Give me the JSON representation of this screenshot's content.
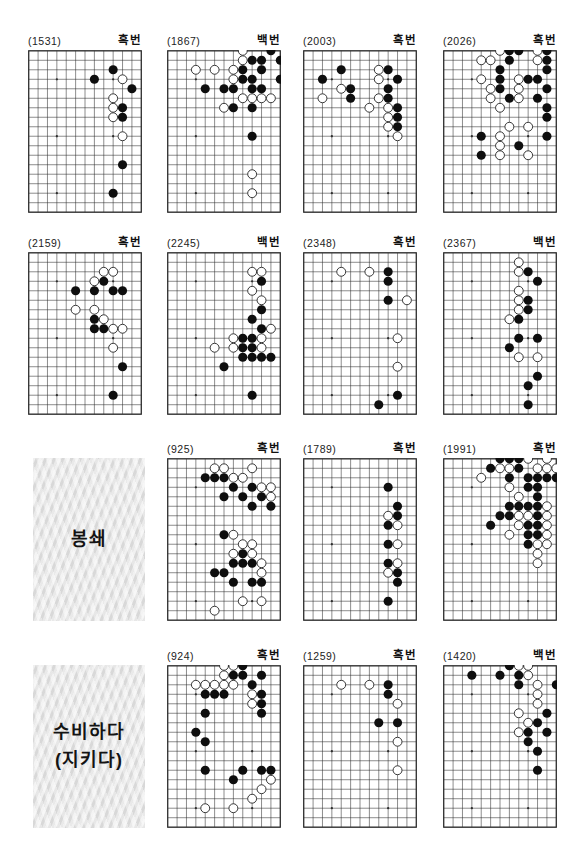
{
  "page": {
    "background": "#ffffff",
    "line_color": "#2e2e2e",
    "black_stone": "#0e0e0e",
    "white_stone": "#ffffff"
  },
  "board_grid": {
    "cols": 13,
    "rows": 18,
    "stars": [
      [
        3,
        3
      ],
      [
        9,
        3
      ],
      [
        3,
        9
      ],
      [
        9,
        9
      ],
      [
        3,
        15
      ],
      [
        9,
        15
      ]
    ]
  },
  "cells": [
    {
      "kind": "board",
      "num": "(1531)",
      "turn": "흑번",
      "black": [
        [
          9,
          2
        ],
        [
          7,
          3
        ],
        [
          11,
          4
        ],
        [
          10,
          6
        ],
        [
          10,
          7
        ],
        [
          10,
          12
        ],
        [
          9,
          15
        ]
      ],
      "white": [
        [
          10,
          3
        ],
        [
          9,
          5
        ],
        [
          9,
          6
        ],
        [
          9,
          7
        ],
        [
          10,
          9
        ]
      ]
    },
    {
      "kind": "board",
      "num": "(1867)",
      "turn": "백번",
      "black": [
        [
          11,
          0
        ],
        [
          9,
          1
        ],
        [
          10,
          1
        ],
        [
          12,
          1
        ],
        [
          8,
          2
        ],
        [
          10,
          2
        ],
        [
          8,
          3
        ],
        [
          9,
          3
        ],
        [
          12,
          3
        ],
        [
          4,
          4
        ],
        [
          6,
          4
        ],
        [
          7,
          4
        ],
        [
          9,
          4
        ],
        [
          10,
          4
        ],
        [
          7,
          6
        ],
        [
          9,
          6
        ],
        [
          9,
          9
        ]
      ],
      "white": [
        [
          8,
          0
        ],
        [
          8,
          1
        ],
        [
          3,
          2
        ],
        [
          5,
          2
        ],
        [
          7,
          2
        ],
        [
          7,
          3
        ],
        [
          8,
          5
        ],
        [
          9,
          5
        ],
        [
          10,
          5
        ],
        [
          11,
          5
        ],
        [
          6,
          6
        ],
        [
          9,
          13
        ],
        [
          9,
          15
        ]
      ]
    },
    {
      "kind": "board",
      "num": "(2003)",
      "turn": "흑번",
      "black": [
        [
          4,
          2
        ],
        [
          9,
          2
        ],
        [
          2,
          3
        ],
        [
          10,
          3
        ],
        [
          5,
          4
        ],
        [
          9,
          4
        ],
        [
          5,
          5
        ],
        [
          9,
          5
        ],
        [
          10,
          6
        ],
        [
          10,
          7
        ],
        [
          10,
          8
        ]
      ],
      "white": [
        [
          8,
          2
        ],
        [
          8,
          3
        ],
        [
          4,
          4
        ],
        [
          2,
          5
        ],
        [
          8,
          5
        ],
        [
          7,
          6
        ],
        [
          9,
          6
        ],
        [
          9,
          7
        ],
        [
          9,
          8
        ],
        [
          10,
          9
        ]
      ]
    },
    {
      "kind": "board",
      "num": "(2026)",
      "turn": "흑번",
      "black": [
        [
          7,
          0
        ],
        [
          8,
          0
        ],
        [
          11,
          0
        ],
        [
          7,
          1
        ],
        [
          11,
          1
        ],
        [
          6,
          2
        ],
        [
          11,
          2
        ],
        [
          6,
          3
        ],
        [
          9,
          3
        ],
        [
          10,
          3
        ],
        [
          6,
          4
        ],
        [
          11,
          4
        ],
        [
          7,
          5
        ],
        [
          10,
          5
        ],
        [
          11,
          6
        ],
        [
          11,
          7
        ],
        [
          4,
          9
        ],
        [
          11,
          9
        ],
        [
          8,
          10
        ],
        [
          4,
          11
        ]
      ],
      "white": [
        [
          6,
          0
        ],
        [
          10,
          0
        ],
        [
          4,
          1
        ],
        [
          5,
          1
        ],
        [
          10,
          1
        ],
        [
          4,
          3
        ],
        [
          8,
          3
        ],
        [
          5,
          4
        ],
        [
          8,
          4
        ],
        [
          5,
          5
        ],
        [
          8,
          5
        ],
        [
          6,
          6
        ],
        [
          7,
          8
        ],
        [
          9,
          8
        ],
        [
          6,
          9
        ],
        [
          6,
          10
        ],
        [
          6,
          11
        ],
        [
          9,
          11
        ]
      ]
    },
    {
      "kind": "board",
      "num": "(2159)",
      "turn": "흑번",
      "black": [
        [
          8,
          3
        ],
        [
          5,
          4
        ],
        [
          7,
          4
        ],
        [
          9,
          4
        ],
        [
          10,
          4
        ],
        [
          7,
          7
        ],
        [
          7,
          8
        ],
        [
          8,
          8
        ],
        [
          10,
          12
        ],
        [
          9,
          15
        ]
      ],
      "white": [
        [
          8,
          2
        ],
        [
          9,
          2
        ],
        [
          7,
          3
        ],
        [
          5,
          6
        ],
        [
          7,
          6
        ],
        [
          8,
          7
        ],
        [
          9,
          8
        ],
        [
          10,
          8
        ],
        [
          9,
          10
        ]
      ]
    },
    {
      "kind": "board",
      "num": "(2245)",
      "turn": "백번",
      "black": [
        [
          10,
          3
        ],
        [
          10,
          6
        ],
        [
          9,
          7
        ],
        [
          10,
          8
        ],
        [
          8,
          9
        ],
        [
          9,
          9
        ],
        [
          8,
          10
        ],
        [
          9,
          10
        ],
        [
          8,
          11
        ],
        [
          9,
          11
        ],
        [
          10,
          11
        ],
        [
          11,
          11
        ],
        [
          6,
          12
        ],
        [
          9,
          15
        ]
      ],
      "white": [
        [
          9,
          2
        ],
        [
          10,
          2
        ],
        [
          9,
          4
        ],
        [
          10,
          5
        ],
        [
          11,
          8
        ],
        [
          7,
          9
        ],
        [
          10,
          9
        ],
        [
          5,
          10
        ],
        [
          7,
          10
        ],
        [
          10,
          10
        ]
      ]
    },
    {
      "kind": "board",
      "num": "(2348)",
      "turn": "흑번",
      "black": [
        [
          9,
          2
        ],
        [
          9,
          3
        ],
        [
          9,
          5
        ],
        [
          10,
          15
        ],
        [
          8,
          16
        ]
      ],
      "white": [
        [
          4,
          2
        ],
        [
          7,
          2
        ],
        [
          11,
          5
        ],
        [
          10,
          9
        ],
        [
          10,
          12
        ]
      ]
    },
    {
      "kind": "board",
      "num": "(2367)",
      "turn": "백번",
      "black": [
        [
          9,
          2
        ],
        [
          10,
          3
        ],
        [
          9,
          5
        ],
        [
          9,
          6
        ],
        [
          8,
          7
        ],
        [
          8,
          9
        ],
        [
          10,
          9
        ],
        [
          7,
          10
        ],
        [
          10,
          13
        ],
        [
          9,
          14
        ],
        [
          9,
          16
        ]
      ],
      "white": [
        [
          8,
          1
        ],
        [
          8,
          2
        ],
        [
          8,
          4
        ],
        [
          8,
          5
        ],
        [
          8,
          6
        ],
        [
          7,
          7
        ],
        [
          8,
          11
        ],
        [
          10,
          11
        ]
      ]
    },
    {
      "kind": "note",
      "lines": [
        "봉쇄"
      ]
    },
    {
      "kind": "board",
      "num": "(925)",
      "turn": "흑번",
      "black": [
        [
          4,
          2
        ],
        [
          5,
          2
        ],
        [
          6,
          2
        ],
        [
          7,
          3
        ],
        [
          9,
          3
        ],
        [
          6,
          4
        ],
        [
          8,
          4
        ],
        [
          10,
          4
        ],
        [
          9,
          5
        ],
        [
          11,
          5
        ],
        [
          6,
          8
        ],
        [
          8,
          10
        ],
        [
          7,
          11
        ],
        [
          8,
          11
        ],
        [
          9,
          11
        ],
        [
          5,
          12
        ],
        [
          6,
          12
        ],
        [
          7,
          13
        ],
        [
          9,
          13
        ],
        [
          10,
          13
        ]
      ],
      "white": [
        [
          5,
          1
        ],
        [
          6,
          1
        ],
        [
          9,
          1
        ],
        [
          7,
          2
        ],
        [
          8,
          2
        ],
        [
          10,
          3
        ],
        [
          11,
          3
        ],
        [
          11,
          4
        ],
        [
          7,
          8
        ],
        [
          8,
          9
        ],
        [
          9,
          9
        ],
        [
          7,
          10
        ],
        [
          9,
          10
        ],
        [
          10,
          11
        ],
        [
          10,
          12
        ],
        [
          8,
          15
        ],
        [
          10,
          15
        ],
        [
          5,
          16
        ]
      ]
    },
    {
      "kind": "board",
      "num": "(1789)",
      "turn": "흑번",
      "black": [
        [
          9,
          3
        ],
        [
          10,
          5
        ],
        [
          10,
          6
        ],
        [
          9,
          7
        ],
        [
          9,
          9
        ],
        [
          9,
          11
        ],
        [
          10,
          12
        ],
        [
          10,
          13
        ],
        [
          9,
          15
        ]
      ],
      "white": [
        [
          9,
          6
        ],
        [
          10,
          7
        ],
        [
          10,
          9
        ],
        [
          10,
          11
        ],
        [
          9,
          12
        ]
      ]
    },
    {
      "kind": "board",
      "num": "(1991)",
      "turn": "흑번",
      "black": [
        [
          6,
          0
        ],
        [
          7,
          0
        ],
        [
          8,
          0
        ],
        [
          5,
          1
        ],
        [
          8,
          1
        ],
        [
          7,
          2
        ],
        [
          9,
          2
        ],
        [
          10,
          2
        ],
        [
          11,
          2
        ],
        [
          12,
          2
        ],
        [
          9,
          3
        ],
        [
          10,
          3
        ],
        [
          10,
          4
        ],
        [
          7,
          5
        ],
        [
          8,
          5
        ],
        [
          9,
          5
        ],
        [
          10,
          5
        ],
        [
          6,
          6
        ],
        [
          7,
          6
        ],
        [
          10,
          6
        ],
        [
          5,
          7
        ],
        [
          9,
          7
        ],
        [
          10,
          7
        ],
        [
          9,
          8
        ],
        [
          10,
          8
        ],
        [
          9,
          9
        ]
      ],
      "white": [
        [
          9,
          0
        ],
        [
          11,
          0
        ],
        [
          6,
          1
        ],
        [
          7,
          1
        ],
        [
          10,
          1
        ],
        [
          11,
          1
        ],
        [
          12,
          1
        ],
        [
          4,
          2
        ],
        [
          7,
          3
        ],
        [
          8,
          4
        ],
        [
          11,
          5
        ],
        [
          8,
          6
        ],
        [
          9,
          6
        ],
        [
          11,
          6
        ],
        [
          8,
          7
        ],
        [
          11,
          7
        ],
        [
          7,
          8
        ],
        [
          11,
          8
        ],
        [
          10,
          9
        ],
        [
          11,
          9
        ],
        [
          10,
          10
        ],
        [
          10,
          11
        ]
      ]
    },
    {
      "kind": "note",
      "lines": [
        "수비하다",
        "(지키다)"
      ]
    },
    {
      "kind": "board",
      "num": "(924)",
      "turn": "흑번",
      "black": [
        [
          8,
          0
        ],
        [
          7,
          1
        ],
        [
          8,
          1
        ],
        [
          10,
          1
        ],
        [
          9,
          2
        ],
        [
          4,
          3
        ],
        [
          5,
          3
        ],
        [
          6,
          3
        ],
        [
          10,
          3
        ],
        [
          10,
          4
        ],
        [
          4,
          5
        ],
        [
          10,
          5
        ],
        [
          3,
          7
        ],
        [
          4,
          8
        ],
        [
          4,
          11
        ],
        [
          8,
          11
        ],
        [
          10,
          11
        ],
        [
          11,
          11
        ],
        [
          7,
          12
        ]
      ],
      "white": [
        [
          6,
          0
        ],
        [
          7,
          0
        ],
        [
          6,
          1
        ],
        [
          3,
          2
        ],
        [
          4,
          2
        ],
        [
          5,
          2
        ],
        [
          6,
          2
        ],
        [
          7,
          2
        ],
        [
          9,
          3
        ],
        [
          9,
          4
        ],
        [
          11,
          12
        ],
        [
          10,
          13
        ],
        [
          9,
          14
        ],
        [
          4,
          15
        ],
        [
          7,
          15
        ]
      ]
    },
    {
      "kind": "board",
      "num": "(1259)",
      "turn": "흑번",
      "black": [
        [
          9,
          2
        ],
        [
          9,
          3
        ],
        [
          8,
          6
        ],
        [
          10,
          6
        ]
      ],
      "white": [
        [
          4,
          2
        ],
        [
          7,
          2
        ],
        [
          10,
          4
        ],
        [
          10,
          8
        ],
        [
          10,
          11
        ]
      ]
    },
    {
      "kind": "board",
      "num": "(1420)",
      "turn": "백번",
      "black": [
        [
          7,
          0
        ],
        [
          3,
          1
        ],
        [
          6,
          1
        ],
        [
          8,
          1
        ],
        [
          8,
          2
        ],
        [
          12,
          2
        ],
        [
          11,
          5
        ],
        [
          10,
          6
        ],
        [
          9,
          7
        ],
        [
          11,
          7
        ],
        [
          9,
          8
        ],
        [
          10,
          9
        ],
        [
          10,
          11
        ]
      ],
      "white": [
        [
          8,
          0
        ],
        [
          9,
          0
        ],
        [
          9,
          1
        ],
        [
          10,
          2
        ],
        [
          10,
          3
        ],
        [
          10,
          4
        ],
        [
          8,
          5
        ],
        [
          9,
          6
        ],
        [
          8,
          7
        ]
      ]
    }
  ],
  "layout_note": {
    "col_x": [
      28,
      167,
      303,
      443
    ],
    "row_y": [
      50,
      252,
      458,
      665
    ],
    "board_w": 114,
    "board_h": 163
  }
}
